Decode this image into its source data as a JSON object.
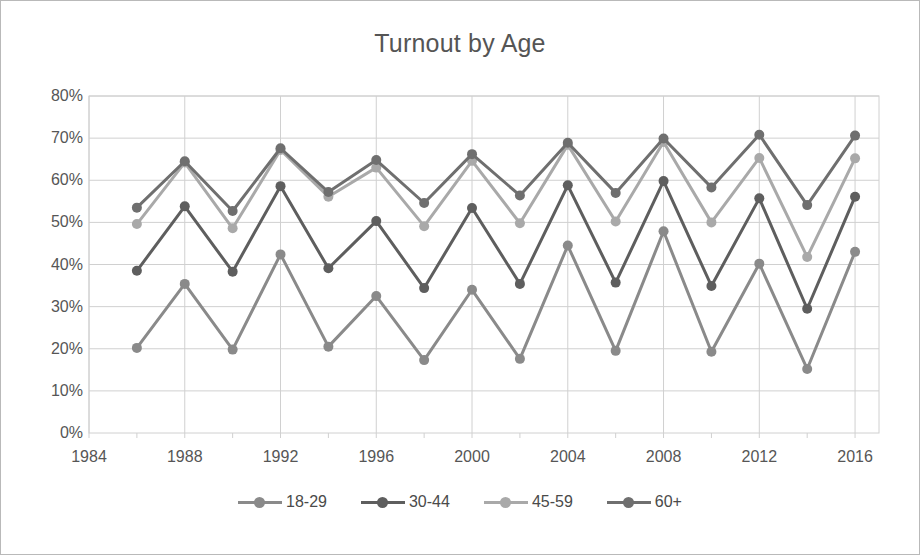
{
  "chart_data": {
    "type": "line",
    "title": "Turnout by Age",
    "xlabel": "",
    "ylabel": "",
    "xlim": [
      1984,
      2017
    ],
    "ylim": [
      0,
      80
    ],
    "ytick_values": [
      0,
      10,
      20,
      30,
      40,
      50,
      60,
      70,
      80
    ],
    "ytick_labels": [
      "0%",
      "10%",
      "20%",
      "30%",
      "40%",
      "50%",
      "60%",
      "70%",
      "80%"
    ],
    "xtick_values": [
      1984,
      1988,
      1992,
      1996,
      2000,
      2004,
      2008,
      2012,
      2016
    ],
    "xtick_labels": [
      "1984",
      "1988",
      "1992",
      "1996",
      "2000",
      "2004",
      "2008",
      "2012",
      "2016"
    ],
    "x_minor_step": 2,
    "grid": true,
    "grid_color": "#d0d0d0",
    "legend_position": "bottom",
    "x": [
      1986,
      1988,
      1990,
      1992,
      1994,
      1996,
      1998,
      2000,
      2002,
      2004,
      2006,
      2008,
      2010,
      2012,
      2014,
      2016
    ],
    "series": [
      {
        "name": "18-29",
        "color": "#8a8a8a",
        "values": [
          20.2,
          35.4,
          19.8,
          42.4,
          20.5,
          32.5,
          17.3,
          34.0,
          17.6,
          44.5,
          19.5,
          47.9,
          19.3,
          40.2,
          15.2,
          43.0
        ]
      },
      {
        "name": "30-44",
        "color": "#5e5e5e",
        "values": [
          38.5,
          53.8,
          38.3,
          58.6,
          39.1,
          50.3,
          34.4,
          53.4,
          35.4,
          58.8,
          35.7,
          59.8,
          34.9,
          55.7,
          29.5,
          56.1
        ]
      },
      {
        "name": "45-59",
        "color": "#a9a9a9",
        "values": [
          49.6,
          64.2,
          48.6,
          67.2,
          56.1,
          63.0,
          49.1,
          64.6,
          49.8,
          68.4,
          50.2,
          69.1,
          50.0,
          65.3,
          41.8,
          65.2
        ]
      },
      {
        "name": "60+",
        "color": "#6f6f6f",
        "values": [
          53.5,
          64.5,
          52.7,
          67.6,
          57.2,
          64.8,
          54.6,
          66.2,
          56.4,
          68.9,
          57.0,
          69.9,
          58.3,
          70.8,
          54.1,
          70.6
        ]
      }
    ]
  },
  "figure": {
    "background": "#ffffff",
    "border_color": "#b9b9b9",
    "title_color": "#555555",
    "tick_color": "#565656"
  }
}
